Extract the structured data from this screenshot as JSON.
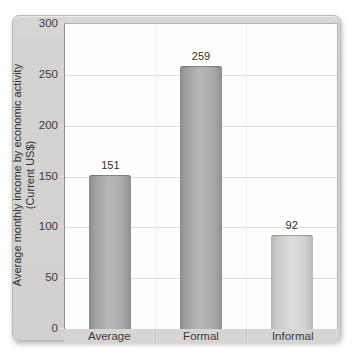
{
  "chart_data": {
    "type": "bar",
    "title": "",
    "ylabel": "Average monthly income by economic activity (Current US$)",
    "ylabel_lines": [
      "Average monthly income by economic activity",
      "(Current US$)"
    ],
    "categories": [
      "Average",
      "Formal",
      "Informal"
    ],
    "values": [
      151,
      259,
      92
    ],
    "data_labels": [
      "151",
      "259",
      "92"
    ],
    "bar_styles": [
      "gray-dark",
      "gray-dark",
      "gray-light"
    ],
    "ylim": [
      0,
      300
    ],
    "yticks": [
      0,
      50,
      100,
      150,
      200,
      250,
      300
    ],
    "grid": "horizontal",
    "legend": "none"
  },
  "colors": {
    "card_bg": "#d4d3d1",
    "plot_bg": "#fefefe",
    "gridline": "#dbdbd9",
    "bar_dark": "#a6a6a6",
    "bar_light": "#cfcfcd",
    "text": "#3a3a3a"
  }
}
